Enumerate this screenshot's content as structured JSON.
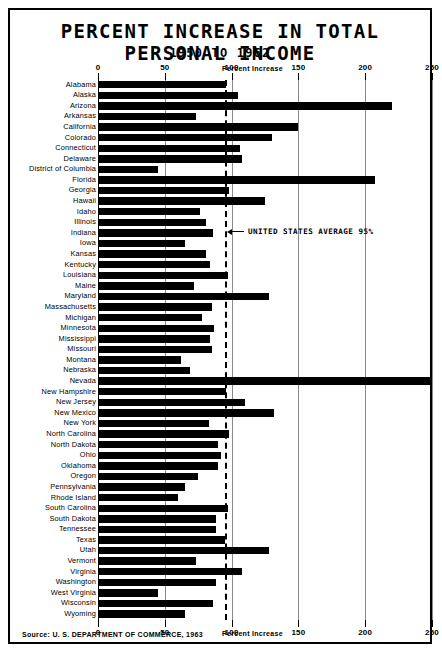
{
  "title": "PERCENT INCREASE IN TOTAL PERSONAL INCOME",
  "subtitle": "1950 TO 1962",
  "source": "Source: U. S. DEPARTMENT OF COMMERCE, 1963",
  "annotation": "UNITED STATES AVERAGE 95%",
  "chart_data": {
    "type": "bar",
    "orientation": "horizontal",
    "title": "PERCENT INCREASE IN TOTAL PERSONAL INCOME",
    "subtitle": "1950 TO 1962",
    "xlabel": "Percent Increase",
    "ylabel": "",
    "xlim": [
      0,
      250
    ],
    "xticks": [
      0,
      50,
      100,
      150,
      200,
      250
    ],
    "xticklabels": [
      "0",
      "50",
      "100",
      "150",
      "200",
      "250"
    ],
    "grid": true,
    "legend": null,
    "reference_line": {
      "label": "UNITED STATES AVERAGE 95%",
      "value": 95
    },
    "note": "Nevada's bar extends past the 250 axis limit (off-scale)",
    "categories": [
      "Alabama",
      "Alaska",
      "Arizona",
      "Arkansas",
      "California",
      "Colorado",
      "Connecticut",
      "Delaware",
      "District of Columbia",
      "Florida",
      "Georgia",
      "Hawaii",
      "Idaho",
      "Illinois",
      "Indiana",
      "Iowa",
      "Kansas",
      "Kentucky",
      "Louisiana",
      "Maine",
      "Maryland",
      "Massachusetts",
      "Michigan",
      "Minnesota",
      "Mississippi",
      "Missouri",
      "Montana",
      "Nebraska",
      "Nevada",
      "New Hampshire",
      "New Jersey",
      "New Mexico",
      "New York",
      "North Carolina",
      "North Dakota",
      "Ohio",
      "Oklahoma",
      "Oregon",
      "Pennsylvania",
      "Rhode Island",
      "South Carolina",
      "South Dakota",
      "Tennessee",
      "Texas",
      "Utah",
      "Vermont",
      "Virginia",
      "Washington",
      "West Virginia",
      "Wisconsin",
      "Wyoming"
    ],
    "values": [
      96,
      105,
      220,
      73,
      150,
      130,
      106,
      108,
      45,
      207,
      98,
      125,
      76,
      81,
      86,
      65,
      81,
      84,
      97,
      72,
      128,
      85,
      78,
      87,
      84,
      85,
      62,
      69,
      252,
      96,
      110,
      132,
      83,
      98,
      90,
      92,
      90,
      75,
      65,
      60,
      97,
      88,
      88,
      95,
      128,
      73,
      108,
      88,
      45,
      86,
      65
    ]
  }
}
